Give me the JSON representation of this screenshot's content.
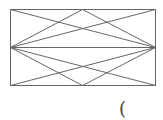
{
  "diagram": {
    "stroke_color": "#666666",
    "stroke_width": 1,
    "rect": {
      "x": 10,
      "y": 9,
      "width": 145,
      "height": 76
    },
    "lines": [
      {
        "name": "midline-horizontal",
        "x1": 10,
        "y1": 47,
        "x2": 155,
        "y2": 47
      },
      {
        "name": "diag-tl-to-midright",
        "x1": 10,
        "y1": 9,
        "x2": 155,
        "y2": 47
      },
      {
        "name": "diag-midleft-to-br",
        "x1": 10,
        "y1": 47,
        "x2": 155,
        "y2": 85
      },
      {
        "name": "diag-bl-to-midright",
        "x1": 10,
        "y1": 85,
        "x2": 155,
        "y2": 47
      },
      {
        "name": "diag-midleft-to-tr",
        "x1": 10,
        "y1": 47,
        "x2": 155,
        "y2": 9
      },
      {
        "name": "diag-topcenter-to-midleft",
        "x1": 82,
        "y1": 9,
        "x2": 10,
        "y2": 47
      },
      {
        "name": "diag-topcenter-to-midright",
        "x1": 82,
        "y1": 9,
        "x2": 155,
        "y2": 47
      },
      {
        "name": "diag-botcenter-to-midleft",
        "x1": 82,
        "y1": 85,
        "x2": 10,
        "y2": 47
      },
      {
        "name": "diag-botcenter-to-midright",
        "x1": 82,
        "y1": 85,
        "x2": 155,
        "y2": 47
      }
    ]
  },
  "caption": {
    "text": "("
  }
}
